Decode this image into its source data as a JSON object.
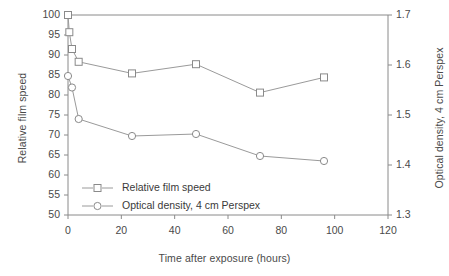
{
  "chart_data": {
    "type": "line",
    "title": "",
    "xlabel": "Time after exposure (hours)",
    "ylabel": "Relative film speed",
    "y2label": "Optical density, 4 cm Perspex",
    "xlim": [
      0,
      120
    ],
    "ylim": [
      50,
      100
    ],
    "y2lim": [
      1.3,
      1.7
    ],
    "xticks": [
      0,
      20,
      40,
      60,
      80,
      100,
      120
    ],
    "xticklabels": [
      "0",
      "20",
      "40",
      "60",
      "80",
      "100",
      "120"
    ],
    "yticks": [
      50,
      55,
      60,
      65,
      70,
      75,
      80,
      85,
      90,
      95,
      100
    ],
    "yticklabels": [
      "50",
      "55",
      "60",
      "65",
      "70",
      "75",
      "80",
      "85",
      "90",
      "95",
      "100"
    ],
    "y2ticks": [
      1.3,
      1.4,
      1.5,
      1.6,
      1.7
    ],
    "y2ticklabels": [
      "1.3",
      "1.4",
      "1.5",
      "1.6",
      "1.7"
    ],
    "grid": false,
    "legend_position": "lower left",
    "series": [
      {
        "name": "Relative film speed",
        "axis": "left",
        "marker": "square",
        "color": "#8c8c8c",
        "x": [
          0,
          0.5,
          1.5,
          4,
          24,
          48,
          72,
          96
        ],
        "values": [
          100,
          95.7,
          91.5,
          88.3,
          85.4,
          87.7,
          80.6,
          84.4
        ]
      },
      {
        "name": "Optical density, 4 cm Perspex",
        "axis": "right",
        "marker": "circle",
        "color": "#8c8c8c",
        "x": [
          0,
          1.5,
          4,
          24,
          48,
          72,
          96
        ],
        "values": [
          1.578,
          1.555,
          1.492,
          1.458,
          1.462,
          1.418,
          1.408
        ],
        "values_left_scale": [
          84.0,
          81.0,
          73.8,
          68.8,
          70.1,
          64.8,
          63.5
        ]
      }
    ],
    "legend": [
      {
        "label": "Relative film speed",
        "marker": "square"
      },
      {
        "label": "Optical density, 4 cm Perspex",
        "marker": "circle"
      }
    ]
  },
  "colors": {
    "axis": "#8a8a8a",
    "line": "#9a9a9a",
    "marker_stroke": "#8a8a8a",
    "marker_fill": "#ffffff",
    "text": "#4a4a4a",
    "background": "#ffffff"
  }
}
